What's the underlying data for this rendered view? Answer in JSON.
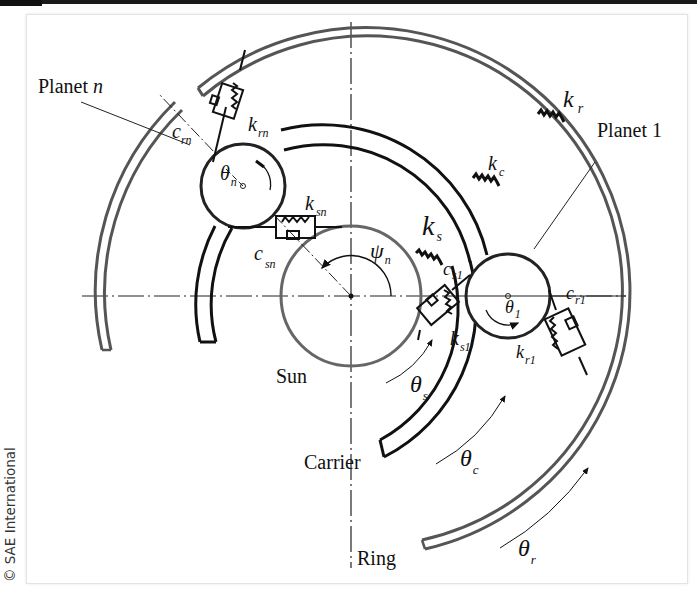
{
  "credit": "© SAE International",
  "labels": {
    "planet_n": "Planet",
    "planet_n_index": "n",
    "planet_1": "Planet 1",
    "sun": "Sun",
    "carrier": "Carrier",
    "ring": "Ring"
  },
  "symbols": {
    "k_r": {
      "base": "k",
      "sub": "r"
    },
    "k_c": {
      "base": "k",
      "sub": "c"
    },
    "k_s": {
      "base": "k",
      "sub": "s"
    },
    "k_rn": {
      "base": "k",
      "sub": "rn"
    },
    "c_rn": {
      "base": "c",
      "sub": "rn"
    },
    "k_sn": {
      "base": "k",
      "sub": "sn"
    },
    "c_sn": {
      "base": "c",
      "sub": "sn"
    },
    "c_s1": {
      "base": "c",
      "sub": "s1"
    },
    "k_s1": {
      "base": "k",
      "sub": "s1"
    },
    "c_r1": {
      "base": "c",
      "sub": "r1"
    },
    "k_r1": {
      "base": "k",
      "sub": "r1"
    },
    "theta_n": {
      "base": "θ",
      "sub": "n"
    },
    "theta_1": {
      "base": "θ",
      "sub": "1"
    },
    "theta_s": {
      "base": "θ",
      "sub": "s"
    },
    "theta_c": {
      "base": "θ",
      "sub": "c"
    },
    "theta_r": {
      "base": "θ",
      "sub": "r"
    },
    "psi_n": {
      "base": "ψ",
      "sub": "n"
    }
  },
  "colors": {
    "ring": "#555555",
    "carrier": "#111111",
    "sun": "#666666",
    "ink": "#111111"
  }
}
